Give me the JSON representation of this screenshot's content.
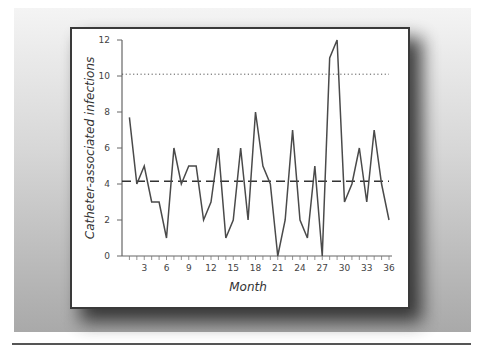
{
  "chart_data": {
    "type": "line",
    "title": "",
    "xlabel": "Month",
    "ylabel": "Catheter-associated infections",
    "xlim": [
      0,
      36
    ],
    "ylim": [
      0,
      12
    ],
    "x_ticks": [
      3,
      6,
      9,
      12,
      15,
      18,
      21,
      24,
      27,
      30,
      33,
      36
    ],
    "y_ticks": [
      0,
      2,
      4,
      6,
      8,
      10,
      12
    ],
    "grid": false,
    "legend": null,
    "x": [
      1,
      2,
      3,
      4,
      5,
      6,
      7,
      8,
      9,
      10,
      11,
      12,
      13,
      14,
      15,
      16,
      17,
      18,
      19,
      20,
      21,
      22,
      23,
      24,
      25,
      26,
      27,
      28,
      29,
      30,
      31,
      32,
      33,
      34,
      35,
      36
    ],
    "series": [
      {
        "name": "Catheter-associated infections",
        "color": "#4a4a4a",
        "values": [
          7.7,
          4,
          5,
          3,
          3,
          1,
          6,
          4,
          5,
          5,
          2,
          3,
          6,
          1,
          2,
          6,
          2,
          8,
          5,
          4,
          0,
          2,
          7,
          2,
          1,
          5,
          0,
          11,
          12,
          3,
          4,
          6,
          3,
          7,
          4,
          2
        ]
      }
    ],
    "reference_lines": [
      {
        "name": "center-line",
        "style": "dashed",
        "value": 4.15,
        "color": "#333333"
      },
      {
        "name": "upper-control-limit",
        "style": "dotted",
        "value": 10.1,
        "color": "#555555"
      }
    ]
  },
  "labels": {
    "x_axis_title": "Month",
    "y_axis_title": "Catheter-associated infections"
  }
}
